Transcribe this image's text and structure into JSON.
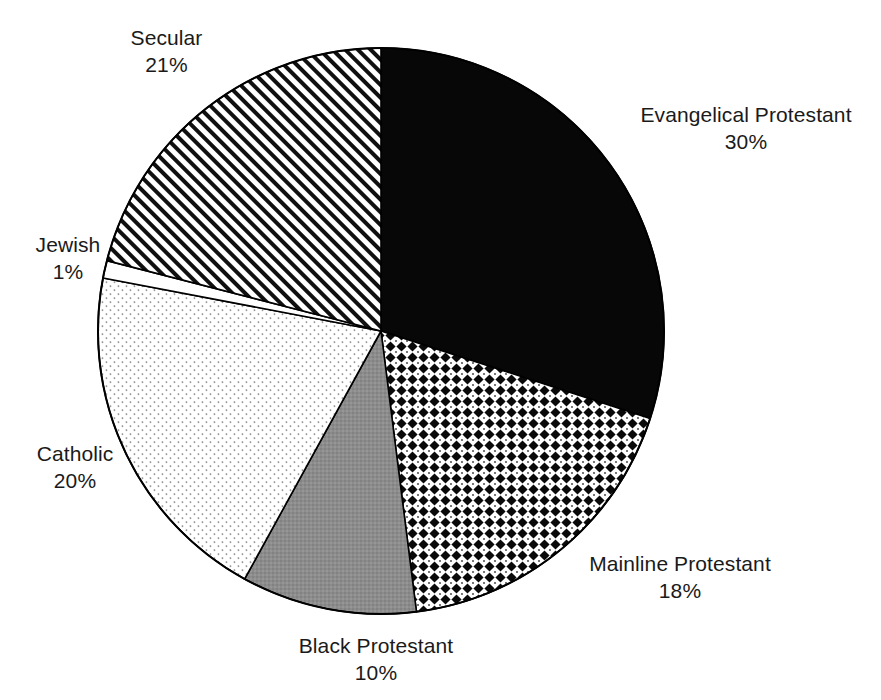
{
  "chart_data": {
    "type": "pie",
    "title": "",
    "subtitle": "",
    "xlabel": "",
    "ylabel": "",
    "legend_position": "none",
    "grid": false,
    "units": "percent",
    "start_angle_deg": 0,
    "direction": "clockwise",
    "categories": [
      "Evangelical Protestant",
      "Mainline Protestant",
      "Black Protestant",
      "Catholic",
      "Jewish",
      "Secular"
    ],
    "values": [
      30,
      18,
      10,
      20,
      1,
      21
    ],
    "slices": [
      {
        "label": "Evangelical Protestant",
        "value": 30,
        "value_text": "30%",
        "fill_style": "solid-black",
        "fill_color": "#000000",
        "start_deg": 0,
        "end_deg": 108
      },
      {
        "label": "Mainline Protestant",
        "value": 18,
        "value_text": "18%",
        "fill_style": "diamond-grid",
        "fill_color": "#000000",
        "start_deg": 108,
        "end_deg": 172.8
      },
      {
        "label": "Black Protestant",
        "value": 10,
        "value_text": "10%",
        "fill_style": "solid-gray",
        "fill_color": "#8c8c8c",
        "start_deg": 172.8,
        "end_deg": 208.8
      },
      {
        "label": "Catholic",
        "value": 20,
        "value_text": "20%",
        "fill_style": "light-stipple",
        "fill_color": "#ffffff",
        "start_deg": 208.8,
        "end_deg": 280.8
      },
      {
        "label": "Jewish",
        "value": 1,
        "value_text": "1%",
        "fill_style": "none-white",
        "fill_color": "#ffffff",
        "start_deg": 280.8,
        "end_deg": 284.4
      },
      {
        "label": "Secular",
        "value": 21,
        "value_text": "21%",
        "fill_style": "diagonal-hatch",
        "fill_color": "#000000",
        "start_deg": 284.4,
        "end_deg": 360
      }
    ]
  },
  "labels": {
    "secular": {
      "name": "Secular",
      "value": "21%"
    },
    "evangelical": {
      "name": "Evangelical Protestant",
      "value": "30%"
    },
    "jewish": {
      "name": "Jewish",
      "value": "1%"
    },
    "catholic": {
      "name": "Catholic",
      "value": "20%"
    },
    "mainline": {
      "name": "Mainline Protestant",
      "value": "18%"
    },
    "black_protestant": {
      "name": "Black Protestant",
      "value": "10%"
    }
  },
  "colors": {
    "background": "#ffffff",
    "outline": "#000000",
    "text": "#1a1a1a",
    "gray_slice": "#8c8c8c"
  }
}
